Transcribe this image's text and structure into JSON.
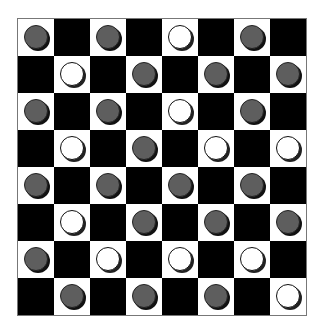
{
  "board": {
    "size": 8,
    "top_left_square": "light",
    "colors": {
      "light": "#ffffff",
      "dark": "#000000",
      "gray_piece": "#5e5e5e",
      "white_piece": "#ffffff"
    },
    "rows": [
      [
        "gray",
        null,
        "gray",
        null,
        "white",
        null,
        "gray",
        null
      ],
      [
        null,
        "white",
        null,
        "gray",
        null,
        "gray",
        null,
        "gray"
      ],
      [
        "gray",
        null,
        "gray",
        null,
        "white",
        null,
        "gray",
        null
      ],
      [
        null,
        "white",
        null,
        "gray",
        null,
        "white",
        null,
        "white"
      ],
      [
        "gray",
        null,
        "gray",
        null,
        "gray",
        null,
        "gray",
        null
      ],
      [
        null,
        "white",
        null,
        "gray",
        null,
        "gray",
        null,
        "gray"
      ],
      [
        "gray",
        null,
        "white",
        null,
        "white",
        null,
        "white",
        null
      ],
      [
        null,
        "gray",
        null,
        "gray",
        null,
        "gray",
        null,
        "white"
      ]
    ]
  }
}
